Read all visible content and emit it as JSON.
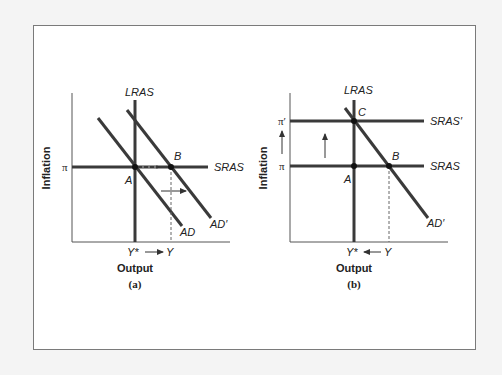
{
  "figure": {
    "panels": [
      {
        "id": "a",
        "caption": "(a)",
        "x_axis_label": "Output",
        "y_axis_label": "Inflation",
        "y_tick": "π",
        "x_ticks": {
          "left": "Y*",
          "right": "Y"
        },
        "curves": {
          "lras": "LRAS",
          "sras": "SRAS",
          "ad": "AD",
          "ad_prime": "AD′"
        },
        "points": {
          "a": "A",
          "b": "B"
        }
      },
      {
        "id": "b",
        "caption": "(b)",
        "x_axis_label": "Output",
        "y_axis_label": "Inflation",
        "y_ticks": {
          "low": "π",
          "high": "π′"
        },
        "x_ticks": {
          "left": "Y*",
          "right": "Y"
        },
        "curves": {
          "lras": "LRAS",
          "sras": "SRAS",
          "sras_prime": "SRAS′",
          "ad_prime": "AD′"
        },
        "points": {
          "a": "A",
          "b": "B",
          "c": "C"
        }
      }
    ]
  },
  "colors": {
    "line": "#3a3a3a",
    "frame": "#7a7a7a",
    "background": "#f4f4f4"
  }
}
